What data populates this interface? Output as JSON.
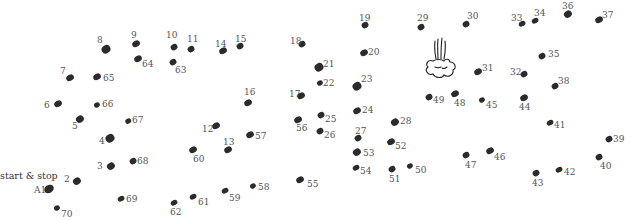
{
  "puzzle": {
    "start_label": "start & stop",
    "dot_color": "#2b2b2b",
    "label_color": "#555555",
    "icon": "steam-puff-cloud-icon",
    "dots": [
      {
        "n": "A1",
        "x": 49,
        "y": 189,
        "r": 4.5,
        "lx": 34,
        "ly": 186
      },
      {
        "n": "2",
        "x": 77,
        "y": 181,
        "r": 3.8,
        "lx": 64,
        "ly": 175
      },
      {
        "n": "3",
        "x": 111,
        "y": 166,
        "r": 3.8,
        "lx": 97,
        "ly": 162
      },
      {
        "n": "4",
        "x": 110,
        "y": 138,
        "r": 4.2,
        "lx": 99,
        "ly": 137
      },
      {
        "n": "5",
        "x": 80,
        "y": 119,
        "r": 3.8,
        "lx": 72,
        "ly": 122
      },
      {
        "n": "6",
        "x": 58,
        "y": 104,
        "r": 3.5,
        "lx": 44,
        "ly": 101
      },
      {
        "n": "7",
        "x": 70,
        "y": 78,
        "r": 3.5,
        "lx": 60,
        "ly": 67
      },
      {
        "n": "8",
        "x": 106,
        "y": 49,
        "r": 4.2,
        "lx": 97,
        "ly": 36
      },
      {
        "n": "9",
        "x": 136,
        "y": 44,
        "r": 3.5,
        "lx": 131,
        "ly": 31
      },
      {
        "n": "10",
        "x": 174,
        "y": 47,
        "r": 3.2,
        "lx": 166,
        "ly": 31
      },
      {
        "n": "11",
        "x": 191,
        "y": 49,
        "r": 3.2,
        "lx": 187,
        "ly": 35
      },
      {
        "n": "12",
        "x": 216,
        "y": 126,
        "r": 3.5,
        "lx": 202,
        "ly": 125
      },
      {
        "n": "13",
        "x": 228,
        "y": 150,
        "r": 3.5,
        "lx": 223,
        "ly": 138
      },
      {
        "n": "14",
        "x": 223,
        "y": 51,
        "r": 3.5,
        "lx": 215,
        "ly": 40
      },
      {
        "n": "15",
        "x": 240,
        "y": 46,
        "r": 3.2,
        "lx": 235,
        "ly": 35
      },
      {
        "n": "16",
        "x": 248,
        "y": 103,
        "r": 3.5,
        "lx": 244,
        "ly": 88
      },
      {
        "n": "17",
        "x": 301,
        "y": 96,
        "r": 3.5,
        "lx": 289,
        "ly": 90
      },
      {
        "n": "18",
        "x": 302,
        "y": 44,
        "r": 3.2,
        "lx": 290,
        "ly": 37
      },
      {
        "n": "19",
        "x": 365,
        "y": 25,
        "r": 3.2,
        "lx": 359,
        "ly": 14
      },
      {
        "n": "20",
        "x": 364,
        "y": 53,
        "r": 3.5,
        "lx": 368,
        "ly": 48
      },
      {
        "n": "21",
        "x": 319,
        "y": 67,
        "r": 4.2,
        "lx": 323,
        "ly": 60
      },
      {
        "n": "22",
        "x": 320,
        "y": 83,
        "r": 2.8,
        "lx": 323,
        "ly": 79
      },
      {
        "n": "23",
        "x": 357,
        "y": 86,
        "r": 4.2,
        "lx": 361,
        "ly": 75
      },
      {
        "n": "24",
        "x": 357,
        "y": 111,
        "r": 3.5,
        "lx": 362,
        "ly": 106
      },
      {
        "n": "25",
        "x": 321,
        "y": 115,
        "r": 3.2,
        "lx": 325,
        "ly": 115
      },
      {
        "n": "26",
        "x": 320,
        "y": 131,
        "r": 3.2,
        "lx": 324,
        "ly": 131
      },
      {
        "n": "27",
        "x": 358,
        "y": 138,
        "r": 3.2,
        "lx": 355,
        "ly": 127
      },
      {
        "n": "28",
        "x": 395,
        "y": 122,
        "r": 3.8,
        "lx": 400,
        "ly": 117
      },
      {
        "n": "29",
        "x": 421,
        "y": 27,
        "r": 3.2,
        "lx": 417,
        "ly": 14
      },
      {
        "n": "30",
        "x": 466,
        "y": 24,
        "r": 3.2,
        "lx": 467,
        "ly": 12
      },
      {
        "n": "31",
        "x": 478,
        "y": 72,
        "r": 3.5,
        "lx": 482,
        "ly": 64
      },
      {
        "n": "32",
        "x": 524,
        "y": 74,
        "r": 3.2,
        "lx": 510,
        "ly": 68
      },
      {
        "n": "33",
        "x": 522,
        "y": 24,
        "r": 3.0,
        "lx": 511,
        "ly": 14
      },
      {
        "n": "34",
        "x": 535,
        "y": 21,
        "r": 3.0,
        "lx": 534,
        "ly": 9
      },
      {
        "n": "35",
        "x": 542,
        "y": 56,
        "r": 3.2,
        "lx": 548,
        "ly": 50
      },
      {
        "n": "36",
        "x": 568,
        "y": 14,
        "r": 3.8,
        "lx": 562,
        "ly": 2
      },
      {
        "n": "37",
        "x": 599,
        "y": 20,
        "r": 3.5,
        "lx": 602,
        "ly": 11
      },
      {
        "n": "38",
        "x": 555,
        "y": 86,
        "r": 3.2,
        "lx": 558,
        "ly": 77
      },
      {
        "n": "39",
        "x": 609,
        "y": 139,
        "r": 3.2,
        "lx": 613,
        "ly": 135
      },
      {
        "n": "40",
        "x": 599,
        "y": 157,
        "r": 3.2,
        "lx": 600,
        "ly": 162
      },
      {
        "n": "41",
        "x": 550,
        "y": 123,
        "r": 3.0,
        "lx": 554,
        "ly": 121
      },
      {
        "n": "42",
        "x": 559,
        "y": 170,
        "r": 3.0,
        "lx": 564,
        "ly": 168
      },
      {
        "n": "43",
        "x": 536,
        "y": 173,
        "r": 3.2,
        "lx": 532,
        "ly": 179
      },
      {
        "n": "44",
        "x": 524,
        "y": 98,
        "r": 3.5,
        "lx": 519,
        "ly": 103
      },
      {
        "n": "45",
        "x": 482,
        "y": 100,
        "r": 2.8,
        "lx": 486,
        "ly": 101
      },
      {
        "n": "46",
        "x": 490,
        "y": 151,
        "r": 3.5,
        "lx": 494,
        "ly": 153
      },
      {
        "n": "47",
        "x": 466,
        "y": 155,
        "r": 3.2,
        "lx": 465,
        "ly": 161
      },
      {
        "n": "48",
        "x": 455,
        "y": 94,
        "r": 3.5,
        "lx": 454,
        "ly": 99
      },
      {
        "n": "49",
        "x": 429,
        "y": 97,
        "r": 3.2,
        "lx": 433,
        "ly": 96
      },
      {
        "n": "50",
        "x": 410,
        "y": 166,
        "r": 2.8,
        "lx": 415,
        "ly": 166
      },
      {
        "n": "51",
        "x": 392,
        "y": 169,
        "r": 3.2,
        "lx": 389,
        "ly": 175
      },
      {
        "n": "52",
        "x": 391,
        "y": 142,
        "r": 3.5,
        "lx": 395,
        "ly": 142
      },
      {
        "n": "53",
        "x": 357,
        "y": 152,
        "r": 3.8,
        "lx": 363,
        "ly": 149
      },
      {
        "n": "54",
        "x": 356,
        "y": 168,
        "r": 3.0,
        "lx": 360,
        "ly": 167
      },
      {
        "n": "55",
        "x": 300,
        "y": 180,
        "r": 3.5,
        "lx": 307,
        "ly": 180
      },
      {
        "n": "56",
        "x": 298,
        "y": 120,
        "r": 3.5,
        "lx": 296,
        "ly": 124
      },
      {
        "n": "57",
        "x": 250,
        "y": 135,
        "r": 3.5,
        "lx": 255,
        "ly": 132
      },
      {
        "n": "58",
        "x": 253,
        "y": 186,
        "r": 2.8,
        "lx": 258,
        "ly": 183
      },
      {
        "n": "59",
        "x": 225,
        "y": 191,
        "r": 3.0,
        "lx": 229,
        "ly": 194
      },
      {
        "n": "60",
        "x": 193,
        "y": 150,
        "r": 3.5,
        "lx": 193,
        "ly": 155
      },
      {
        "n": "61",
        "x": 193,
        "y": 197,
        "r": 3.0,
        "lx": 198,
        "ly": 198
      },
      {
        "n": "62",
        "x": 174,
        "y": 203,
        "r": 3.0,
        "lx": 170,
        "ly": 208
      },
      {
        "n": "63",
        "x": 173,
        "y": 62,
        "r": 3.2,
        "lx": 175,
        "ly": 66
      },
      {
        "n": "64",
        "x": 138,
        "y": 59,
        "r": 3.5,
        "lx": 142,
        "ly": 60
      },
      {
        "n": "65",
        "x": 97,
        "y": 77,
        "r": 3.5,
        "lx": 103,
        "ly": 74
      },
      {
        "n": "66",
        "x": 97,
        "y": 105,
        "r": 2.8,
        "lx": 102,
        "ly": 100
      },
      {
        "n": "67",
        "x": 128,
        "y": 121,
        "r": 2.6,
        "lx": 132,
        "ly": 116
      },
      {
        "n": "68",
        "x": 133,
        "y": 161,
        "r": 3.2,
        "lx": 137,
        "ly": 157
      },
      {
        "n": "69",
        "x": 121,
        "y": 199,
        "r": 3.0,
        "lx": 126,
        "ly": 195
      },
      {
        "n": "70",
        "x": 57,
        "y": 208,
        "r": 2.8,
        "lx": 61,
        "ly": 210
      }
    ]
  }
}
